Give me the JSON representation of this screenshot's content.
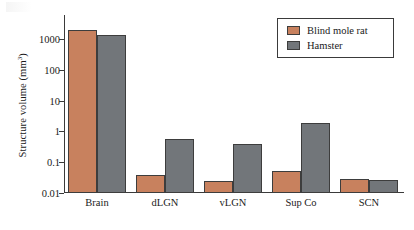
{
  "chart_data": {
    "type": "bar",
    "title": "",
    "xlabel": "",
    "ylabel": "Structure volume (mm",
    "ylabel_sup": "3",
    "ylabel_tail": ")",
    "categories": [
      "Brain",
      "dLGN",
      "vLGN",
      "Sup Co",
      "SCN"
    ],
    "series": [
      {
        "name": "Blind mole rat",
        "color": "#c8815e",
        "values": [
          2000,
          0.038,
          0.025,
          0.05,
          0.028
        ]
      },
      {
        "name": "Hamster",
        "color": "#72767a",
        "values": [
          1400,
          0.55,
          0.38,
          1.9,
          0.027
        ]
      }
    ],
    "yscale": "log",
    "ylim": [
      0.01,
      4000
    ],
    "yticks": [
      0.01,
      0.1,
      1,
      10,
      100,
      1000
    ],
    "ytick_labels": [
      "0.01",
      "0.1",
      "1",
      "10",
      "100",
      "1000"
    ],
    "grid": false,
    "legend_position": "top-right"
  },
  "legend": {
    "entries": [
      {
        "label": "Blind mole rat",
        "swatch": "a"
      },
      {
        "label": "Hamster",
        "swatch": "b"
      }
    ]
  }
}
